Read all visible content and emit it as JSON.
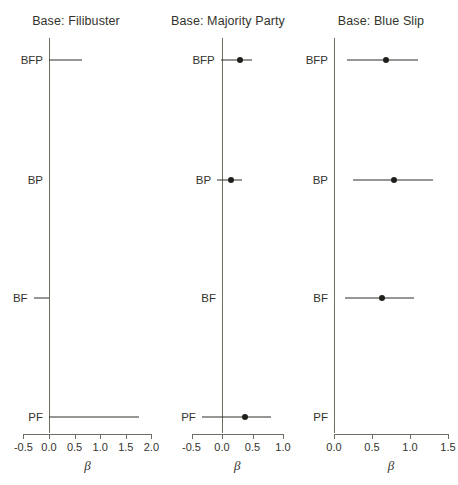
{
  "figure": {
    "width": 458,
    "height": 485,
    "background": "#ffffff",
    "line_color": "#2e2e28",
    "axis_color": "#6d6d62",
    "text_color": "#33332c"
  },
  "chart_data": {
    "type": "scatter",
    "subtype": "coefficient-forest-plot",
    "title": "",
    "xlabel": "β",
    "ylabel": "",
    "grid": false,
    "legend": "none",
    "reference_line_x": 0,
    "row_categories": [
      "BFP",
      "BP",
      "BF",
      "PF"
    ],
    "panels": [
      {
        "title": "Base: Filibuster",
        "xlabel": "β",
        "xlim": [
          -0.62,
          2.12
        ],
        "xticks": [
          -0.5,
          0.0,
          0.5,
          1.0,
          1.5,
          2.0
        ],
        "xticklabels": [
          "-0.5",
          "0.0",
          "0.5",
          "1.0",
          "1.5",
          "2.0"
        ],
        "points": [
          {
            "category": "BFP",
            "estimate": null,
            "ci_low": 0.0,
            "ci_high": 0.65,
            "has_point": false
          },
          {
            "category": "BP",
            "estimate": null,
            "ci_low": null,
            "ci_high": null,
            "has_point": false
          },
          {
            "category": "BF",
            "estimate": null,
            "ci_low": -0.3,
            "ci_high": 0.0,
            "has_point": false
          },
          {
            "category": "PF",
            "estimate": null,
            "ci_low": 0.0,
            "ci_high": 1.75,
            "has_point": false
          }
        ]
      },
      {
        "title": "Base: Majority Party",
        "xlabel": "β",
        "xlim": [
          -0.62,
          1.12
        ],
        "xticks": [
          -0.5,
          0.0,
          0.5,
          1.0
        ],
        "xticklabels": [
          "-0.5",
          "0.0",
          "0.5",
          "1.0"
        ],
        "points": [
          {
            "category": "BFP",
            "estimate": 0.3,
            "ci_low": -0.02,
            "ci_high": 0.5,
            "has_point": true
          },
          {
            "category": "BP",
            "estimate": 0.15,
            "ci_low": -0.08,
            "ci_high": 0.33,
            "has_point": true
          },
          {
            "category": "BF",
            "estimate": null,
            "ci_low": null,
            "ci_high": null,
            "has_point": false
          },
          {
            "category": "PF",
            "estimate": 0.37,
            "ci_low": -0.33,
            "ci_high": 0.8,
            "has_point": true
          }
        ]
      },
      {
        "title": "Base: Blue Slip",
        "xlabel": "β",
        "xlim": [
          -0.08,
          1.62
        ],
        "xticks": [
          0.0,
          0.5,
          1.0,
          1.5
        ],
        "xticklabels": [
          "0.0",
          "0.5",
          "1.0",
          "1.5"
        ],
        "points": [
          {
            "category": "BFP",
            "estimate": 0.68,
            "ci_low": 0.17,
            "ci_high": 1.1,
            "has_point": true
          },
          {
            "category": "BP",
            "estimate": 0.79,
            "ci_low": 0.25,
            "ci_high": 1.3,
            "has_point": true
          },
          {
            "category": "BF",
            "estimate": 0.63,
            "ci_low": 0.15,
            "ci_high": 1.05,
            "has_point": true
          },
          {
            "category": "PF",
            "estimate": null,
            "ci_low": null,
            "ci_high": null,
            "has_point": false
          }
        ]
      }
    ]
  },
  "layout": {
    "panel_lefts": [
      0,
      152,
      304
    ],
    "panel_widths": [
      152,
      152,
      154
    ],
    "plot_left_px": [
      49,
      222,
      334
    ],
    "plot_px_per_unit": [
      51.2,
      61.0,
      76.0
    ],
    "row_y_px": [
      60,
      180,
      298,
      417
    ],
    "axis_y_px": 434,
    "tick_len_px": 5,
    "ticklabel_y_px": 441,
    "axistitle_y_px": 458,
    "title_y_px": 14,
    "zero_top_px": 38,
    "zero_bottom_px": 433
  }
}
